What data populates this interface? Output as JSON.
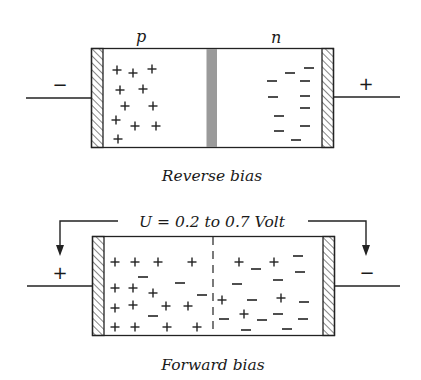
{
  "reverse_bias": {
    "caption": "Reverse bias",
    "p_label": "p",
    "n_label": "n",
    "left_terminal": "−",
    "right_terminal": "+",
    "depletion_region": "wide gray barrier at junction",
    "p_side_charges": [
      {
        "s": "+",
        "x": 117,
        "y": 70
      },
      {
        "s": "+",
        "x": 133,
        "y": 73
      },
      {
        "s": "+",
        "x": 152,
        "y": 69
      },
      {
        "s": "+",
        "x": 120,
        "y": 90
      },
      {
        "s": "+",
        "x": 143,
        "y": 89
      },
      {
        "s": "+",
        "x": 125,
        "y": 106
      },
      {
        "s": "+",
        "x": 153,
        "y": 106
      },
      {
        "s": "+",
        "x": 116,
        "y": 120
      },
      {
        "s": "+",
        "x": 135,
        "y": 126
      },
      {
        "s": "+",
        "x": 156,
        "y": 126
      },
      {
        "s": "+",
        "x": 118,
        "y": 139
      }
    ],
    "n_side_charges": [
      {
        "s": "−",
        "x": 309,
        "y": 68
      },
      {
        "s": "−",
        "x": 290,
        "y": 73
      },
      {
        "s": "−",
        "x": 272,
        "y": 81
      },
      {
        "s": "−",
        "x": 305,
        "y": 81
      },
      {
        "s": "−",
        "x": 273,
        "y": 97
      },
      {
        "s": "−",
        "x": 305,
        "y": 96
      },
      {
        "s": "−",
        "x": 305,
        "y": 108
      },
      {
        "s": "−",
        "x": 279,
        "y": 116
      },
      {
        "s": "−",
        "x": 279,
        "y": 131
      },
      {
        "s": "−",
        "x": 305,
        "y": 126
      },
      {
        "s": "−",
        "x": 296,
        "y": 140
      }
    ]
  },
  "forward_bias": {
    "caption": "Forward bias",
    "voltage_label": "U = 0.2 to 0.7 Volt",
    "left_terminal": "+",
    "right_terminal": "−",
    "p_side_charges": [
      {
        "s": "+",
        "x": 115,
        "y": 262
      },
      {
        "s": "+",
        "x": 135,
        "y": 262
      },
      {
        "s": "+",
        "x": 158,
        "y": 262
      },
      {
        "s": "+",
        "x": 192,
        "y": 262
      },
      {
        "s": "−",
        "x": 143,
        "y": 277
      },
      {
        "s": "−",
        "x": 180,
        "y": 283
      },
      {
        "s": "+",
        "x": 115,
        "y": 288
      },
      {
        "s": "+",
        "x": 133,
        "y": 288
      },
      {
        "s": "+",
        "x": 153,
        "y": 293
      },
      {
        "s": "−",
        "x": 202,
        "y": 295
      },
      {
        "s": "+",
        "x": 115,
        "y": 308
      },
      {
        "s": "+",
        "x": 133,
        "y": 305
      },
      {
        "s": "+",
        "x": 166,
        "y": 306
      },
      {
        "s": "+",
        "x": 188,
        "y": 306
      },
      {
        "s": "−",
        "x": 153,
        "y": 316
      },
      {
        "s": "+",
        "x": 115,
        "y": 327
      },
      {
        "s": "+",
        "x": 135,
        "y": 327
      },
      {
        "s": "+",
        "x": 167,
        "y": 327
      },
      {
        "s": "+",
        "x": 197,
        "y": 327
      }
    ],
    "n_side_charges": [
      {
        "s": "+",
        "x": 239,
        "y": 262
      },
      {
        "s": "−",
        "x": 256,
        "y": 269
      },
      {
        "s": "+",
        "x": 274,
        "y": 262
      },
      {
        "s": "−",
        "x": 298,
        "y": 256
      },
      {
        "s": "−",
        "x": 300,
        "y": 272
      },
      {
        "s": "−",
        "x": 237,
        "y": 284
      },
      {
        "s": "−",
        "x": 278,
        "y": 280
      },
      {
        "s": "+",
        "x": 222,
        "y": 300
      },
      {
        "s": "−",
        "x": 252,
        "y": 300
      },
      {
        "s": "+",
        "x": 281,
        "y": 298
      },
      {
        "s": "−",
        "x": 304,
        "y": 302
      },
      {
        "s": "−",
        "x": 224,
        "y": 319
      },
      {
        "s": "+",
        "x": 244,
        "y": 314
      },
      {
        "s": "−",
        "x": 262,
        "y": 320
      },
      {
        "s": "−",
        "x": 278,
        "y": 314
      },
      {
        "s": "−",
        "x": 303,
        "y": 319
      },
      {
        "s": "−",
        "x": 246,
        "y": 330
      },
      {
        "s": "−",
        "x": 287,
        "y": 329
      }
    ]
  }
}
